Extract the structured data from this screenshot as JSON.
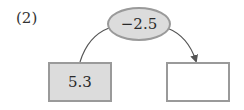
{
  "problem": {
    "label": "(2)"
  },
  "diagram": {
    "operator": {
      "value": "−2.5",
      "shape": "ellipse",
      "fill": "#dcdcdc"
    },
    "input_box": {
      "value": "5.3",
      "fill": "#dcdcdc"
    },
    "output_box": {
      "value": "",
      "fill": "#ffffff"
    },
    "colors": {
      "stroke": "#9a9a9a",
      "line": "#555555"
    }
  }
}
